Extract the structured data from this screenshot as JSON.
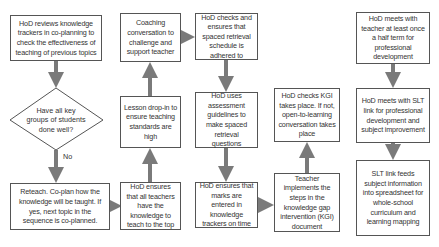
{
  "heading": "Flowchart: HoD knowledge tracking process",
  "colors": {
    "arrow": "#7a7a7a",
    "border": "#555555",
    "text": "#333333"
  },
  "nodes": {
    "review": "HoD reviews knowledge trackers in co-planning to check the effectiveness of teaching of previous topics",
    "decision": "Have all key groups of students done well?",
    "decision_no_label": "No",
    "reteach": "Reteach. Co-plan how the knowledge will be taught. If yes, next topic in the sequence is co-planned.",
    "ensure_teachers": "HoD ensures that all teachers have the knowledge to teach to the top",
    "lesson_dropin": "Lesson drop-in to ensure teaching standards are high",
    "coaching": "Coaching conversation to challenge and support teacher",
    "spaced_schedule": "HoD checks and ensures that spaced retrieval schedule is adhered to",
    "assessment_guidelines": "HoD uses assessment guidelines to make spaced retrieval questions",
    "marks_entered": "HoD ensures that marks are entered in knowledge trackers on time",
    "teacher_implements": "Teacher implements the steps in the knowledge gap intervention (KGI) document",
    "kgi_check": "HoD checks KGI takes place. If not, open-to-learning conversation takes place",
    "meet_teacher": "HoD meets with teacher at least once a half term for professional development",
    "meet_slt": "HoD meets with SLT link for professional development and subject improvement",
    "slt_feeds": "SLT link feeds subject information into spreadsheet for whole-school curriculum and learning mapping"
  }
}
